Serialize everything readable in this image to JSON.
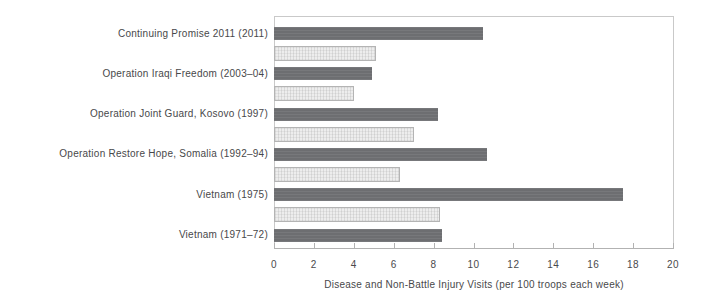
{
  "chart_data": {
    "type": "bar",
    "orientation": "horizontal",
    "title": "",
    "xlabel": "Disease and Non-Battle Injury Visits (per 100 troops each week)",
    "ylabel": "",
    "xlim": [
      0,
      20
    ],
    "xticks": [
      0,
      2,
      4,
      6,
      8,
      10,
      12,
      14,
      16,
      18,
      20
    ],
    "grid": false,
    "legend_position": "none",
    "categories": [
      "Continuing Promise 2011 (2011)",
      "Operation Iraqi Freedom (2003–04)",
      "Operation Joint Guard, Kosovo (1997)",
      "Operation Restore Hope, Somalia (1992–94)",
      "Vietnam (1975)",
      "Vietnam (1971–72)"
    ],
    "series": [
      {
        "name": "primary-dark-bar",
        "color": "#6d6e71",
        "values": [
          10.5,
          4.9,
          8.2,
          10.7,
          17.5,
          8.4
        ]
      },
      {
        "name": "secondary-light-bar",
        "color": "#ededed",
        "border_color": "#b4b4b4",
        "values": [
          5.1,
          4.0,
          7.0,
          6.3,
          8.3,
          null
        ]
      }
    ]
  },
  "colors": {
    "background": "#ffffff",
    "plot_border": "#c9c9c9",
    "axis_line": "#b2b2b2",
    "text": "#48484a"
  }
}
